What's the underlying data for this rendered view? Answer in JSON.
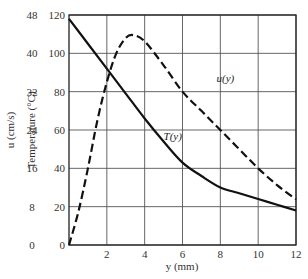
{
  "chart_data": {
    "type": "line",
    "title": "",
    "xlabel": "y (mm)",
    "ylabel_left_outer": "u (cm/s)",
    "ylabel_left_inner": "Temperature (°C)",
    "xlim": [
      0,
      12
    ],
    "ylim_temperature": [
      0,
      120
    ],
    "ylim_velocity": [
      0,
      48
    ],
    "grid": true,
    "legend": "none (curves labeled inline)",
    "x_ticks": [
      {
        "value": 2,
        "label": "2"
      },
      {
        "value": 4,
        "label": "4"
      },
      {
        "value": 6,
        "label": "6"
      },
      {
        "value": 8,
        "label": "8"
      },
      {
        "value": 10,
        "label": "10"
      },
      {
        "value": 12,
        "label": "12"
      }
    ],
    "temperature_ticks": [
      {
        "value": 0,
        "label": "0"
      },
      {
        "value": 20,
        "label": "20"
      },
      {
        "value": 40,
        "label": "40"
      },
      {
        "value": 60,
        "label": "60"
      },
      {
        "value": 80,
        "label": "80"
      },
      {
        "value": 100,
        "label": "100"
      },
      {
        "value": 120,
        "label": "120"
      }
    ],
    "velocity_ticks": [
      {
        "value": 0,
        "label": "0"
      },
      {
        "value": 8,
        "label": "8"
      },
      {
        "value": 16,
        "label": "16"
      },
      {
        "value": 24,
        "label": "24"
      },
      {
        "value": 32,
        "label": "32"
      },
      {
        "value": 40,
        "label": "40"
      },
      {
        "value": 48,
        "label": "48"
      }
    ],
    "series": [
      {
        "name": "T(y)",
        "axis": "temperature",
        "style": "solid",
        "x": [
          0,
          1,
          2,
          3,
          4,
          5,
          6,
          7,
          8,
          9,
          10,
          11,
          12
        ],
        "values": [
          118,
          105,
          92,
          79,
          66,
          54,
          43,
          36,
          30,
          27,
          24,
          21,
          18
        ]
      },
      {
        "name": "u(y)",
        "axis": "velocity",
        "style": "dashed",
        "x": [
          0,
          0.5,
          1,
          1.5,
          2,
          2.5,
          3,
          3.4,
          4,
          5,
          6,
          7,
          8,
          9,
          10,
          11,
          12
        ],
        "values": [
          0,
          7,
          16,
          26,
          34,
          40,
          43.2,
          43.8,
          42.5,
          37.5,
          32,
          28,
          24,
          20,
          16,
          12.5,
          9.5
        ]
      }
    ],
    "annotations": [
      {
        "text": "u(y)",
        "x": 7.8,
        "y_temperature": 85
      },
      {
        "text": "T(y)",
        "x": 5.0,
        "y_temperature": 55
      }
    ]
  },
  "labels": {
    "xlabel": "y (mm)",
    "ylabel_velocity": "u (cm/s)",
    "ylabel_temperature": "Temperature (°C)",
    "series_T": "T(y)",
    "series_u": "u(y)"
  },
  "colors": {
    "curve": "#111111",
    "grid": "#555555",
    "text": "#333333"
  }
}
